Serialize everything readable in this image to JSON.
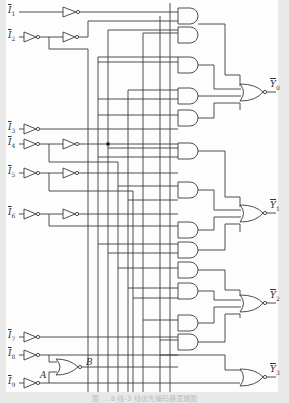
{
  "figure": {
    "caption": "图 … 8 线-3 线优先编码器逻辑图"
  },
  "inputs": [
    {
      "id": "I1",
      "label": "I",
      "sub": "1",
      "y": 12
    },
    {
      "id": "I2",
      "label": "I",
      "sub": "2",
      "y": 37
    },
    {
      "id": "I3",
      "label": "I",
      "sub": "3",
      "y": 129
    },
    {
      "id": "I4",
      "label": "I",
      "sub": "4",
      "y": 144
    },
    {
      "id": "I5",
      "label": "I",
      "sub": "5",
      "y": 173
    },
    {
      "id": "I6",
      "label": "I",
      "sub": "6",
      "y": 214
    },
    {
      "id": "I7",
      "label": "I",
      "sub": "7",
      "y": 337
    },
    {
      "id": "I8",
      "label": "I",
      "sub": "8",
      "y": 355
    },
    {
      "id": "I9",
      "label": "I",
      "sub": "9",
      "y": 383
    }
  ],
  "outputs": [
    {
      "id": "Y0",
      "label": "Y",
      "sub": "0",
      "y": 92
    },
    {
      "id": "Y1",
      "label": "Y",
      "sub": "1",
      "y": 213
    },
    {
      "id": "Y2",
      "label": "Y",
      "sub": "2",
      "y": 303
    },
    {
      "id": "Y3",
      "label": "Y",
      "sub": "3",
      "y": 377
    }
  ],
  "nodes": {
    "A": "A",
    "B": "B"
  },
  "gates": {
    "inverters": 15,
    "and_gates": 12,
    "nor_gates": 5
  }
}
